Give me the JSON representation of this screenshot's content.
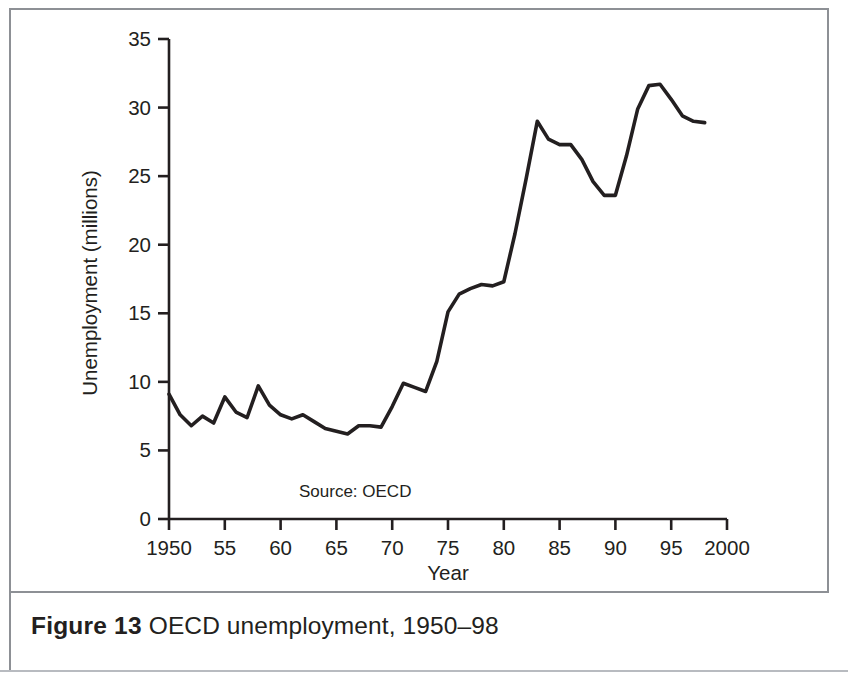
{
  "figure": {
    "label": "Figure 13",
    "caption": "OECD unemployment, 1950–98"
  },
  "chart_data": {
    "type": "line",
    "title": "",
    "subtitle": "",
    "xlabel": "Year",
    "ylabel": "Unemployment (millions)",
    "annotation": "Source: OECD",
    "grid": false,
    "legend": null,
    "xlim": [
      1949,
      2000
    ],
    "ylim": [
      0,
      35
    ],
    "yticks": [
      0,
      5,
      10,
      15,
      20,
      25,
      30,
      35
    ],
    "ytick_labels": [
      "0",
      "5",
      "10",
      "15",
      "20",
      "25",
      "30",
      "35"
    ],
    "xticks": [
      1950,
      1955,
      1960,
      1965,
      1970,
      1975,
      1980,
      1985,
      1990,
      1995,
      2000
    ],
    "xtick_labels": [
      "1950",
      "55",
      "60",
      "65",
      "70",
      "75",
      "80",
      "85",
      "90",
      "95",
      "2000"
    ],
    "series": [
      {
        "name": "OECD unemployment",
        "color": "#231f20",
        "x": [
          1950,
          1951,
          1952,
          1953,
          1954,
          1955,
          1956,
          1957,
          1958,
          1959,
          1960,
          1961,
          1962,
          1963,
          1964,
          1965,
          1966,
          1967,
          1968,
          1969,
          1970,
          1971,
          1972,
          1973,
          1974,
          1975,
          1976,
          1977,
          1978,
          1979,
          1980,
          1981,
          1982,
          1983,
          1984,
          1985,
          1986,
          1987,
          1988,
          1989,
          1990,
          1991,
          1992,
          1993,
          1994,
          1995,
          1996,
          1997,
          1998
        ],
        "values": [
          9.1,
          7.6,
          6.8,
          7.5,
          7.0,
          8.9,
          7.8,
          7.4,
          9.7,
          8.3,
          7.6,
          7.3,
          7.6,
          7.1,
          6.6,
          6.4,
          6.2,
          6.8,
          6.8,
          6.7,
          8.2,
          9.9,
          9.6,
          9.3,
          11.5,
          15.1,
          16.4,
          16.8,
          17.1,
          17.0,
          17.3,
          20.8,
          24.8,
          29.0,
          27.7,
          27.3,
          27.3,
          26.2,
          24.6,
          23.6,
          23.6,
          26.5,
          29.9,
          31.6,
          31.7,
          30.6,
          29.4,
          29.0,
          28.9
        ]
      }
    ]
  }
}
